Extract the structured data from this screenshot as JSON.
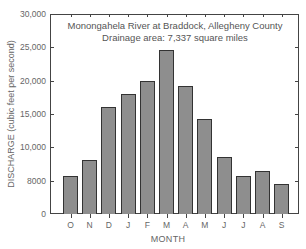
{
  "chart_data": {
    "type": "bar",
    "title": "Monongahela River at Braddock, Allegheny County",
    "subtitle": "Drainage area: 7,337 square miles",
    "xlabel": "MONTH",
    "ylabel": "DISCHARGE (cubic feet per second)",
    "categories": [
      "O",
      "N",
      "D",
      "J",
      "F",
      "M",
      "A",
      "M",
      "J",
      "J",
      "A",
      "S"
    ],
    "values": [
      5700,
      8100,
      16100,
      18000,
      19900,
      24600,
      19200,
      14300,
      8600,
      5700,
      6400,
      4500
    ],
    "ylim": [
      0,
      30000
    ],
    "yticks": [
      0,
      5000,
      10000,
      15000,
      20000,
      25000,
      30000
    ],
    "ytick_labels": [
      "0",
      "8000",
      "10,000",
      "15,000",
      "20,000",
      "25,000",
      "30,000"
    ],
    "grid": false,
    "legend": null,
    "colors": {
      "bar_fill": "#8e8e8e",
      "bar_edge": "#333333",
      "text": "#666666"
    }
  }
}
